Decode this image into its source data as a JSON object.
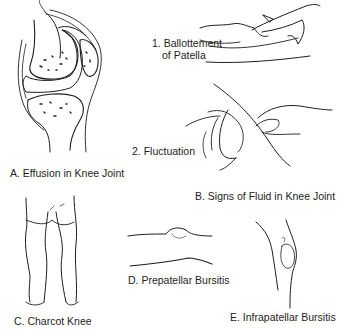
{
  "figure": {
    "panels": [
      {
        "id": "A",
        "label": "A. Effusion in Knee Joint",
        "subject": "knee-joint-sagittal-section"
      },
      {
        "id": "B",
        "label": "B. Signs of Fluid in Knee Joint",
        "subject": "examination-hands",
        "steps": [
          {
            "label_line1": "1. Ballottement",
            "label_line2": "of Patella"
          },
          {
            "label_line1": "2. Fluctuation"
          }
        ]
      },
      {
        "id": "C",
        "label": "C. Charcot Knee",
        "subject": "legs-front-view"
      },
      {
        "id": "D",
        "label": "D. Prepatellar Bursitis",
        "subject": "knee-side-profile"
      },
      {
        "id": "E",
        "label": "E. Infrapatellar Bursitis",
        "subject": "knee-side-bent"
      }
    ],
    "colors": {
      "ink": "#1e1e1e",
      "effusion_fill": "#a9a9a9",
      "background": "#ffffff"
    }
  }
}
